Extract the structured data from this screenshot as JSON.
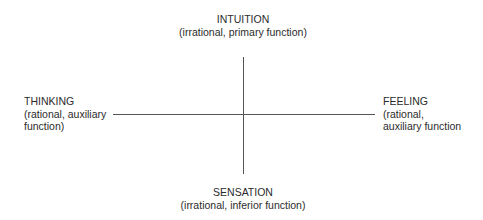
{
  "diagram": {
    "top": {
      "title": "INTUITION",
      "subtitle": "(irrational, primary function)"
    },
    "left": {
      "title": "THINKING",
      "line1": "(rational, auxiliary",
      "line2": "function)"
    },
    "right": {
      "title": "FEELING",
      "line1": "(rational,",
      "line2": "auxiliary function"
    },
    "bottom": {
      "title": "SENSATION",
      "subtitle": "(irrational, inferior function)"
    },
    "colors": {
      "text": "#2b2b2b",
      "axis": "#555555"
    }
  }
}
